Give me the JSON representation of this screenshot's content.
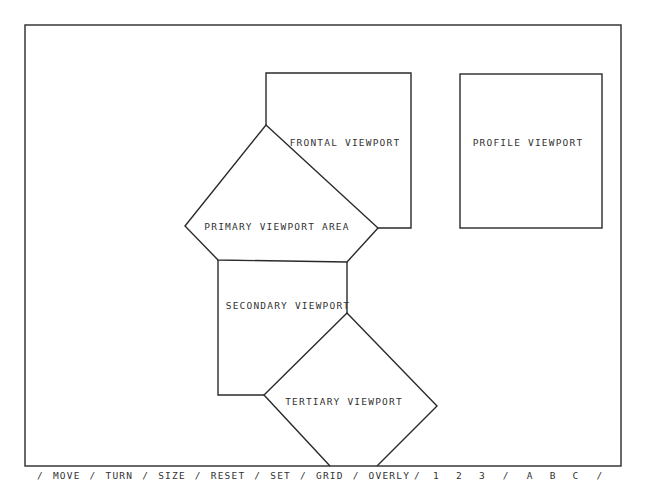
{
  "colors": {
    "background": "#ffffff",
    "line": "#2a2a2a",
    "text": "#333333"
  },
  "viewports": {
    "frontal": {
      "label": "FRONTAL VIEWPORT"
    },
    "profile": {
      "label": "PROFILE VIEWPORT"
    },
    "primary": {
      "label": "PRIMARY VIEWPORT AREA"
    },
    "secondary": {
      "label": "SECONDARY VIEWPORT"
    },
    "tertiary": {
      "label": "TERTIARY VIEWPORT"
    }
  },
  "menu": {
    "separator": "/",
    "commands": [
      "MOVE",
      "TURN",
      "SIZE",
      "RESET",
      "SET",
      "GRID",
      "OVERLY"
    ],
    "numbers": [
      "1",
      "2",
      "3"
    ],
    "letters": [
      "A",
      "B",
      "C"
    ]
  }
}
